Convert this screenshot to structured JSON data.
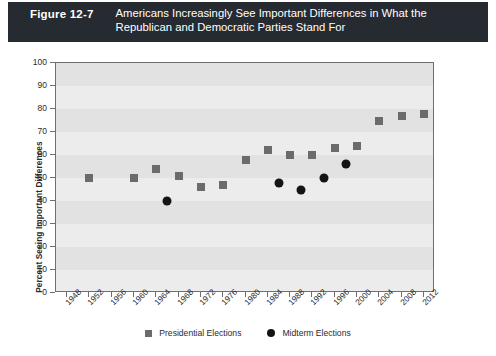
{
  "header": {
    "figure_number": "Figure 12-7",
    "title_line_1": "Americans Increasingly See Important Differences in What the",
    "title_line_2": "Republican and Democratic Parties Stand For",
    "band_color": "#262a31",
    "text_color": "#ffffff"
  },
  "legend": {
    "presidential_label": "Presidential Elections",
    "midterm_label": "Midterm Elections",
    "presidential_color": "#6b6b6e",
    "midterm_color": "#141414"
  },
  "chart_data": {
    "type": "scatter",
    "title": "Americans Increasingly See Important Differences in What the Republican and Democratic Parties Stand For",
    "xlabel": "",
    "ylabel": "Percent Seeing Important Differences",
    "xlim": [
      1946,
      2014
    ],
    "ylim": [
      0,
      100
    ],
    "ytick_step": 10,
    "xtick_step": 4,
    "grid": "horizontal-bands",
    "legend_position": "bottom-center",
    "yticks": [
      0,
      10,
      20,
      30,
      40,
      50,
      60,
      70,
      80,
      90,
      100
    ],
    "xticks": [
      1948,
      1952,
      1956,
      1960,
      1964,
      1968,
      1972,
      1976,
      1980,
      1984,
      1988,
      1992,
      1996,
      2000,
      2004,
      2008,
      2012
    ],
    "series": [
      {
        "name": "Presidential Elections",
        "marker": "square",
        "color": "#6b6b6e",
        "points": [
          {
            "x": 1952,
            "y": 50
          },
          {
            "x": 1960,
            "y": 50
          },
          {
            "x": 1964,
            "y": 54
          },
          {
            "x": 1968,
            "y": 51
          },
          {
            "x": 1972,
            "y": 46
          },
          {
            "x": 1976,
            "y": 47
          },
          {
            "x": 1980,
            "y": 58
          },
          {
            "x": 1984,
            "y": 62
          },
          {
            "x": 1988,
            "y": 60
          },
          {
            "x": 1992,
            "y": 60
          },
          {
            "x": 1996,
            "y": 63
          },
          {
            "x": 2000,
            "y": 64
          },
          {
            "x": 2004,
            "y": 75
          },
          {
            "x": 2008,
            "y": 77
          },
          {
            "x": 2012,
            "y": 78
          }
        ]
      },
      {
        "name": "Midterm Elections",
        "marker": "circle",
        "color": "#141414",
        "points": [
          {
            "x": 1966,
            "y": 40
          },
          {
            "x": 1986,
            "y": 48
          },
          {
            "x": 1990,
            "y": 45
          },
          {
            "x": 1994,
            "y": 50
          },
          {
            "x": 1998,
            "y": 56
          }
        ]
      }
    ]
  }
}
